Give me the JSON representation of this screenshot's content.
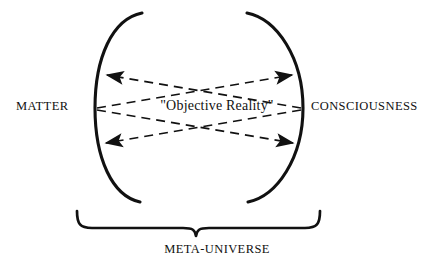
{
  "diagram": {
    "title_text": "META-UNIVERSE",
    "labels": {
      "left": "MATTER",
      "right": "CONSCIOUSNESS",
      "center": "\"Objective Reality\"",
      "bottom": "META-UNIVERSE"
    },
    "colors": {
      "stroke": "#111111",
      "background": "#ffffff",
      "text": "#111111"
    },
    "icons": {
      "left_bracket": "left-curved-bracket",
      "right_bracket": "right-curved-bracket",
      "bottom_brace": "bottom-curly-brace",
      "arrow_top_left": "arrowhead-left",
      "arrow_top_right": "arrowhead-right",
      "arrow_bottom_left": "arrowhead-left",
      "arrow_bottom_right": "arrowhead-right"
    },
    "connectors": [
      {
        "name": "matter-to-consciousness-upper",
        "from": "MATTER",
        "to": "CONSCIOUSNESS",
        "style": "dashed",
        "direction": "right"
      },
      {
        "name": "consciousness-to-matter-upper",
        "from": "CONSCIOUSNESS",
        "to": "MATTER",
        "style": "dashed",
        "direction": "left"
      },
      {
        "name": "matter-to-consciousness-lower",
        "from": "MATTER",
        "to": "CONSCIOUSNESS",
        "style": "dashed",
        "direction": "right"
      },
      {
        "name": "consciousness-to-matter-lower",
        "from": "CONSCIOUSNESS",
        "to": "MATTER",
        "style": "dashed",
        "direction": "left"
      }
    ]
  }
}
